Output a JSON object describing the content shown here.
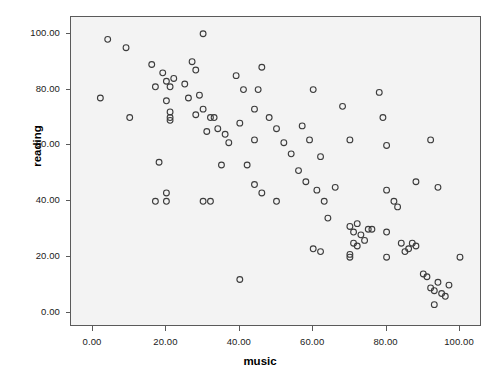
{
  "chart_data": {
    "type": "scatter",
    "title": "",
    "xlabel": "music",
    "ylabel": "reading",
    "xlim": [
      -6,
      106
    ],
    "ylim": [
      -5,
      106
    ],
    "grid": false,
    "legend": null,
    "xticks": [
      "0.00",
      "20.00",
      "40.00",
      "60.00",
      "80.00",
      "100.00"
    ],
    "xtick_values": [
      0,
      20,
      40,
      60,
      80,
      100
    ],
    "yticks": [
      "0.00",
      "20.00",
      "40.00",
      "60.00",
      "80.00",
      "100.00"
    ],
    "ytick_values": [
      0,
      20,
      40,
      60,
      80,
      100
    ],
    "marker": "open-circle",
    "marker_color": "#3c3c3c",
    "plot_background": "#f3f3f3",
    "series": [
      {
        "name": "music vs reading",
        "points": [
          [
            4,
            98
          ],
          [
            2,
            77
          ],
          [
            9,
            95
          ],
          [
            10,
            70
          ],
          [
            16,
            89
          ],
          [
            19,
            86
          ],
          [
            17,
            81
          ],
          [
            20,
            83
          ],
          [
            22,
            84
          ],
          [
            21,
            81
          ],
          [
            20,
            76
          ],
          [
            21,
            72
          ],
          [
            21,
            70
          ],
          [
            21,
            69
          ],
          [
            18,
            54
          ],
          [
            17,
            40
          ],
          [
            20,
            43
          ],
          [
            20,
            40
          ],
          [
            25,
            82
          ],
          [
            27,
            90
          ],
          [
            28,
            87
          ],
          [
            26,
            77
          ],
          [
            29,
            78
          ],
          [
            30,
            100
          ],
          [
            28,
            71
          ],
          [
            30,
            73
          ],
          [
            32,
            70
          ],
          [
            33,
            70
          ],
          [
            31,
            65
          ],
          [
            34,
            66
          ],
          [
            36,
            64
          ],
          [
            37,
            61
          ],
          [
            35,
            53
          ],
          [
            30,
            40
          ],
          [
            32,
            40
          ],
          [
            40,
            12
          ],
          [
            39,
            85
          ],
          [
            41,
            80
          ],
          [
            40,
            68
          ],
          [
            44,
            73
          ],
          [
            46,
            88
          ],
          [
            45,
            80
          ],
          [
            44,
            62
          ],
          [
            42,
            53
          ],
          [
            44,
            46
          ],
          [
            46,
            43
          ],
          [
            48,
            70
          ],
          [
            50,
            66
          ],
          [
            52,
            61
          ],
          [
            50,
            40
          ],
          [
            54,
            57
          ],
          [
            56,
            51
          ],
          [
            58,
            47
          ],
          [
            57,
            67
          ],
          [
            59,
            62
          ],
          [
            60,
            80
          ],
          [
            62,
            56
          ],
          [
            61,
            44
          ],
          [
            63,
            40
          ],
          [
            60,
            23
          ],
          [
            62,
            22
          ],
          [
            64,
            34
          ],
          [
            66,
            45
          ],
          [
            68,
            74
          ],
          [
            70,
            62
          ],
          [
            70,
            31
          ],
          [
            71,
            29
          ],
          [
            72,
            32
          ],
          [
            71,
            25
          ],
          [
            72,
            24
          ],
          [
            70,
            21
          ],
          [
            70,
            20
          ],
          [
            73,
            28
          ],
          [
            74,
            26
          ],
          [
            75,
            30
          ],
          [
            76,
            30
          ],
          [
            78,
            79
          ],
          [
            79,
            70
          ],
          [
            80,
            60
          ],
          [
            80,
            44
          ],
          [
            80,
            29
          ],
          [
            80,
            20
          ],
          [
            82,
            40
          ],
          [
            83,
            38
          ],
          [
            84,
            25
          ],
          [
            85,
            22
          ],
          [
            86,
            23
          ],
          [
            87,
            25
          ],
          [
            88,
            24
          ],
          [
            90,
            14
          ],
          [
            91,
            13
          ],
          [
            92,
            9
          ],
          [
            93,
            8
          ],
          [
            93,
            3
          ],
          [
            94,
            45
          ],
          [
            94,
            11
          ],
          [
            95,
            7
          ],
          [
            96,
            6
          ],
          [
            97,
            10
          ],
          [
            100,
            20
          ],
          [
            92,
            62
          ],
          [
            88,
            47
          ]
        ]
      }
    ]
  }
}
